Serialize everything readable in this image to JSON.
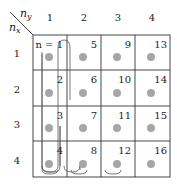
{
  "axes": {
    "ny_label": "n",
    "ny_sub": "y",
    "nx_label": "n",
    "nx_sub": "x",
    "column_headers": [
      "1",
      "2",
      "3",
      "4"
    ],
    "row_headers": [
      "1",
      "2",
      "3",
      "4"
    ]
  },
  "grid": {
    "rows": 4,
    "cols": 4,
    "first_cell_label": "n = 1",
    "cells": [
      [
        "n = 1",
        "5",
        "9",
        "13"
      ],
      [
        "2",
        "6",
        "10",
        "14"
      ],
      [
        "3",
        "7",
        "11",
        "15"
      ],
      [
        "4",
        "8",
        "12",
        "16"
      ]
    ]
  },
  "colors": {
    "line": "#333333",
    "dot": "#a6a6a6",
    "path": "#555555"
  }
}
